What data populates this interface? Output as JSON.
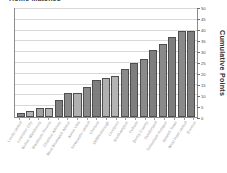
{
  "chart_data": {
    "type": "bar",
    "title": "Home Matches",
    "xlabel": "",
    "ylabel": "Cumulative Points",
    "ylim": [
      0,
      50
    ],
    "ytick_step": 5,
    "yticks": [
      "0",
      "5",
      "10",
      "15",
      "20",
      "25",
      "30",
      "35",
      "40",
      "45",
      "50"
    ],
    "grid": true,
    "legend": "none",
    "axis_position": "right",
    "categories": [
      "Leeds United",
      "Leicester City",
      "Bolton Wanderers",
      "Blackburn Rovers",
      "Charlton Athletic",
      "West Bromwich Albion",
      "Aston Villa",
      "Newcastle United",
      "Chelsea",
      "Middlesbrough",
      "Liverpool",
      "Southampton",
      "Fulham",
      "Derby County",
      "Sunderland",
      "Tottenham Hotspur",
      "Ipswich Town",
      "West Ham United",
      "Everton"
    ],
    "values": [
      2,
      3,
      4,
      4,
      8,
      11,
      11,
      14,
      17,
      18,
      19,
      22,
      25,
      27,
      31,
      34,
      37,
      40,
      40
    ],
    "bar_colors": [
      "#8a8a8a",
      "#b4b4b4",
      "#a0a0a0",
      "#b4b4b4",
      "#7e7e7e",
      "#8a8a8a",
      "#b0b0b0",
      "#8a8a8a",
      "#7e7e7e",
      "#b0b0b0",
      "#b4b4b4",
      "#8a8a8a",
      "#7e7e7e",
      "#8a8a8a",
      "#7e7e7e",
      "#8a8a8a",
      "#7e7e7e",
      "#8a8a8a",
      "#7e7e7e"
    ]
  },
  "colors": {
    "frame": "#8d8d8d",
    "gridline": "#d8d8d8",
    "axis_text": "#4a4a4a",
    "label_text": "#9a9a9a",
    "title_text": "#3a3a3a",
    "background": "#ffffff"
  }
}
